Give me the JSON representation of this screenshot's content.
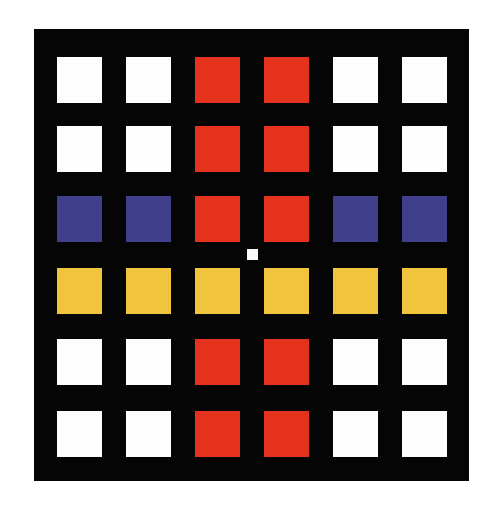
{
  "artwork": {
    "background": "#050505",
    "colors": {
      "W": "#fdfdfd",
      "R": "#e5321c",
      "B": "#3f3f8c",
      "Y": "#f0c43c"
    },
    "grid": [
      [
        "W",
        "W",
        "R",
        "R",
        "W",
        "W"
      ],
      [
        "W",
        "W",
        "R",
        "R",
        "W",
        "W"
      ],
      [
        "B",
        "B",
        "R",
        "R",
        "B",
        "B"
      ],
      [
        "Y",
        "Y",
        "Y",
        "Y",
        "Y",
        "Y"
      ],
      [
        "W",
        "W",
        "R",
        "R",
        "W",
        "W"
      ],
      [
        "W",
        "W",
        "R",
        "R",
        "W",
        "W"
      ]
    ],
    "col_x": [
      23,
      92,
      161,
      230,
      299,
      368
    ],
    "row_y": [
      28,
      97,
      167,
      239,
      310,
      382
    ],
    "center_dot": {
      "x": 213,
      "y": 220,
      "color": "#fafafa"
    }
  }
}
